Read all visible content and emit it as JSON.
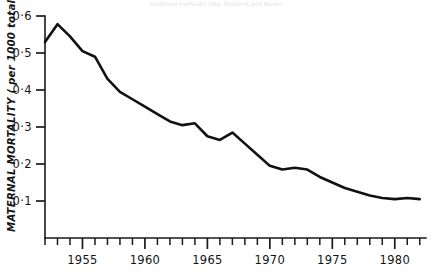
{
  "figure": {
    "background_color": "#ffffff",
    "line_color": "#111111",
    "axis_color": "#1a1a1a",
    "partial_caption": "maternal mortality rate, England and Wales"
  },
  "chart_data": {
    "type": "line",
    "title": "",
    "xlabel": "",
    "ylabel": "MATERNAL MORTALITY (per 1000 total births)",
    "ylabel_display": "MATERNAL MORTALITY ( per 1000 total births )",
    "xlim": [
      1952,
      1982.5
    ],
    "ylim": [
      0,
      0.6
    ],
    "grid": false,
    "legend": "none",
    "y_tick_values": [
      0.1,
      0.2,
      0.3,
      0.4,
      0.5,
      0.6
    ],
    "y_tick_labels": [
      "0·1",
      "0·2",
      "0·3",
      "0·4",
      "0·5",
      "0·6"
    ],
    "x_major_ticks": [
      1955,
      1960,
      1965,
      1970,
      1975,
      1980
    ],
    "x_major_tick_labels": [
      "1955",
      "1960",
      "1965",
      "1970",
      "1975",
      "1980"
    ],
    "x_minor_tick_start": 1952,
    "x_minor_tick_end": 1982,
    "x_minor_tick_step": 1,
    "series": [
      {
        "name": "Maternal mortality",
        "x": [
          1952,
          1953,
          1954,
          1955,
          1956,
          1957,
          1958,
          1959,
          1960,
          1961,
          1962,
          1963,
          1964,
          1965,
          1966,
          1967,
          1968,
          1969,
          1970,
          1971,
          1972,
          1973,
          1974,
          1975,
          1976,
          1977,
          1978,
          1979,
          1980,
          1981,
          1982
        ],
        "values": [
          0.53,
          0.578,
          0.545,
          0.505,
          0.49,
          0.43,
          0.395,
          0.375,
          0.355,
          0.335,
          0.315,
          0.305,
          0.31,
          0.275,
          0.265,
          0.285,
          0.255,
          0.225,
          0.195,
          0.185,
          0.19,
          0.185,
          0.165,
          0.15,
          0.135,
          0.125,
          0.115,
          0.108,
          0.105,
          0.108,
          0.105
        ]
      }
    ],
    "series_note": "Values read from the printed curve; minimum near 0.075 at the right edge"
  },
  "axis": {
    "y_axis_name": "y-axis",
    "x_axis_name": "x-axis"
  }
}
